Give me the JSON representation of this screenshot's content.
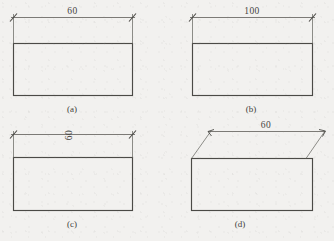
{
  "figure": {
    "background_color": "#f2f1ef",
    "line_color": "#4b4a46",
    "text_color": "#45443f",
    "panels": [
      {
        "id": "a",
        "caption": "(a)",
        "dimension_value": "60",
        "dimension_text_orientation": "horizontal",
        "dimension_text_position": "above-line",
        "extension_line_style": "vertical",
        "terminator_style": "oblique-tick",
        "rect": {
          "x": 13,
          "y": 43,
          "width": 119,
          "height": 52
        },
        "dim_line": {
          "x1": 13,
          "x2": 132,
          "y": 17
        },
        "caption_position": {
          "x": 72,
          "y": 111
        }
      },
      {
        "id": "b",
        "caption": "(b)",
        "dimension_value": "100",
        "dimension_text_orientation": "horizontal",
        "dimension_text_position": "above-line",
        "extension_line_style": "vertical",
        "terminator_style": "oblique-tick",
        "rect": {
          "x": 192,
          "y": 43,
          "width": 120,
          "height": 52
        },
        "dim_line": {
          "x1": 192,
          "x2": 312,
          "y": 17
        },
        "caption_position": {
          "x": 251,
          "y": 111
        }
      },
      {
        "id": "c",
        "caption": "(c)",
        "dimension_value": "60",
        "dimension_text_orientation": "rotated-90",
        "dimension_text_position": "on-line",
        "extension_line_style": "vertical",
        "terminator_style": "oblique-tick",
        "rect": {
          "x": 13,
          "y": 157,
          "width": 119,
          "height": 53
        },
        "dim_line": {
          "x1": 13,
          "x2": 132,
          "y": 134
        },
        "caption_position": {
          "x": 72,
          "y": 226
        }
      },
      {
        "id": "d",
        "caption": "(d)",
        "dimension_value": "60",
        "dimension_text_orientation": "horizontal",
        "dimension_text_position": "above-line",
        "extension_line_style": "oblique-slanted",
        "terminator_style": "outward-arrow",
        "rect": {
          "x": 191,
          "y": 158,
          "width": 121,
          "height": 52
        },
        "dim_line": {
          "x1": 210,
          "x2": 325,
          "y": 131
        },
        "caption_position": {
          "x": 240,
          "y": 226
        }
      }
    ]
  }
}
